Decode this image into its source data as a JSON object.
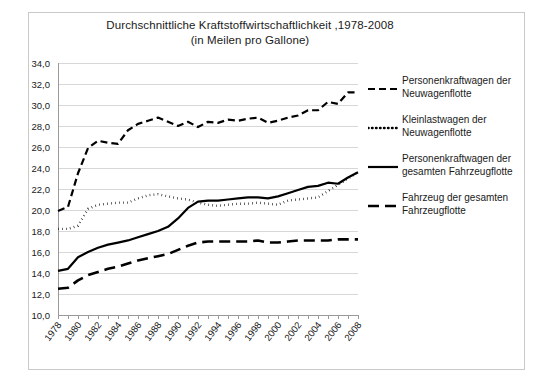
{
  "chart_data": {
    "type": "line",
    "title": "Durchschnittliche Kraftstoffwirtschaftlichkeit ,1978-2008",
    "subtitle": "(in Meilen pro Gallone)",
    "xlabel": "",
    "ylabel": "",
    "ylim": [
      10.0,
      34.0
    ],
    "ytick_step": 2.0,
    "xlim": [
      1978,
      2008
    ],
    "grid": true,
    "legend_position": "right",
    "ytick_labels": [
      "34,0",
      "32,0",
      "30,0",
      "28,0",
      "26,0",
      "24,0",
      "22,0",
      "20,0",
      "18,0",
      "16,0",
      "14,0",
      "12,0",
      "10,0"
    ],
    "ytick_values": [
      34.0,
      32.0,
      30.0,
      28.0,
      26.0,
      24.0,
      22.0,
      20.0,
      18.0,
      16.0,
      14.0,
      12.0,
      10.0
    ],
    "x": [
      1978,
      1979,
      1980,
      1981,
      1982,
      1983,
      1984,
      1985,
      1986,
      1987,
      1988,
      1989,
      1990,
      1991,
      1992,
      1993,
      1994,
      1995,
      1996,
      1997,
      1998,
      1999,
      2000,
      2001,
      2002,
      2003,
      2004,
      2005,
      2006,
      2007,
      2008
    ],
    "xtick_labels": [
      "1978",
      "1980",
      "1982",
      "1984",
      "1986",
      "1988",
      "1990",
      "1992",
      "1994",
      "1996",
      "1998",
      "2000",
      "2002",
      "2004",
      "2006",
      "2008"
    ],
    "xtick_values": [
      1978,
      1980,
      1982,
      1984,
      1986,
      1988,
      1990,
      1992,
      1994,
      1996,
      1998,
      2000,
      2002,
      2004,
      2006,
      2008
    ],
    "series": [
      {
        "name": "Personenkraftwagen der Neuwagenflotte",
        "style": "dashed",
        "color": "#000000",
        "values": [
          19.9,
          20.3,
          23.5,
          25.9,
          26.6,
          26.4,
          26.3,
          27.6,
          28.2,
          28.5,
          28.8,
          28.4,
          28.0,
          28.4,
          27.9,
          28.4,
          28.3,
          28.6,
          28.5,
          28.7,
          28.8,
          28.3,
          28.5,
          28.8,
          29.0,
          29.5,
          29.5,
          30.3,
          30.1,
          31.2,
          31.2
        ]
      },
      {
        "name": "Kleinlastwagen der Neuwagenflotte",
        "style": "dotted",
        "color": "#000000",
        "values": [
          18.2,
          18.2,
          18.5,
          20.1,
          20.5,
          20.6,
          20.7,
          20.7,
          21.1,
          21.4,
          21.5,
          21.3,
          21.1,
          21.0,
          20.7,
          20.5,
          20.4,
          20.5,
          20.6,
          20.6,
          20.7,
          20.6,
          20.5,
          20.9,
          21.0,
          21.1,
          21.2,
          21.8,
          22.4,
          23.0,
          23.6
        ]
      },
      {
        "name": "Personenkraftwagen der gesamten Fahrzeugflotte",
        "style": "solid",
        "color": "#000000",
        "values": [
          14.2,
          14.4,
          15.5,
          16.0,
          16.4,
          16.7,
          16.9,
          17.1,
          17.4,
          17.7,
          18.0,
          18.4,
          19.2,
          20.2,
          20.8,
          20.9,
          20.9,
          21.0,
          21.1,
          21.2,
          21.2,
          21.1,
          21.3,
          21.6,
          21.9,
          22.2,
          22.3,
          22.6,
          22.5,
          23.1,
          23.6
        ]
      },
      {
        "name": "Fahrzeug der gesamten Fahrzeugflotte",
        "style": "long-dashed",
        "color": "#000000",
        "values": [
          12.5,
          12.6,
          13.3,
          13.8,
          14.1,
          14.4,
          14.6,
          14.9,
          15.2,
          15.4,
          15.6,
          15.8,
          16.2,
          16.6,
          16.9,
          17.0,
          17.0,
          17.0,
          17.0,
          17.0,
          17.1,
          16.9,
          16.9,
          17.0,
          17.1,
          17.1,
          17.1,
          17.1,
          17.2,
          17.2,
          17.2
        ]
      }
    ]
  },
  "title": {
    "line1": "Durchschnittliche Kraftstoffwirtschaftlichkeit ,1978-2008",
    "line2": "(in Meilen pro Gallone)"
  },
  "legend": {
    "items": [
      {
        "label": "Personenkraftwagen der Neuwagenflotte",
        "style": "dashed"
      },
      {
        "label": "Kleinlastwagen der Neuwagenflotte",
        "style": "dotted"
      },
      {
        "label": "Personenkraftwagen der gesamten Fahrzeugflotte",
        "style": "solid"
      },
      {
        "label": "Fahrzeug der gesamten Fahrzeugflotte",
        "style": "long-dashed"
      }
    ]
  }
}
